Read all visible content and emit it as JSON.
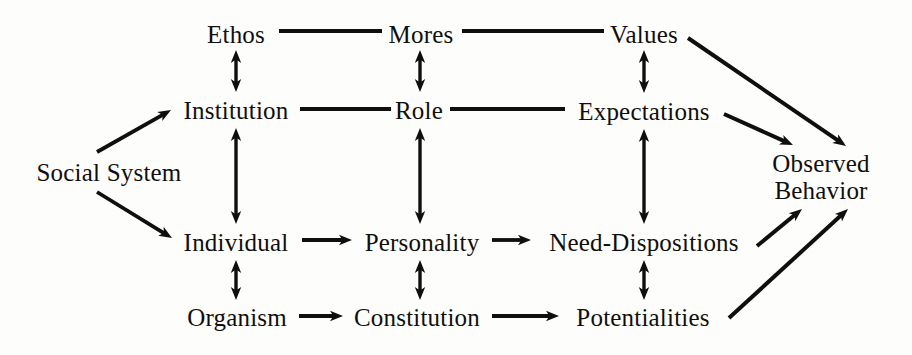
{
  "diagram": {
    "background_color": "#fdfdfb",
    "ink_color": "#100f0d",
    "nodes": [
      {
        "id": "social-system",
        "label": "Social System",
        "x": 109,
        "y": 173,
        "lines": [
          "Social System"
        ]
      },
      {
        "id": "ethos",
        "label": "Ethos",
        "x": 236,
        "y": 35,
        "lines": [
          "Ethos"
        ]
      },
      {
        "id": "mores",
        "label": "Mores",
        "x": 421,
        "y": 35,
        "lines": [
          "Mores"
        ]
      },
      {
        "id": "values",
        "label": "Values",
        "x": 644,
        "y": 35,
        "lines": [
          "Values"
        ]
      },
      {
        "id": "institution",
        "label": "Institution",
        "x": 236,
        "y": 111,
        "lines": [
          "Institution"
        ]
      },
      {
        "id": "role",
        "label": "Role",
        "x": 419,
        "y": 111,
        "lines": [
          "Role"
        ]
      },
      {
        "id": "expectations",
        "label": "Expectations",
        "x": 644,
        "y": 112,
        "lines": [
          "Expectations"
        ]
      },
      {
        "id": "individual",
        "label": "Individual",
        "x": 236,
        "y": 243,
        "lines": [
          "Individual"
        ]
      },
      {
        "id": "personality",
        "label": "Personality",
        "x": 422,
        "y": 243,
        "lines": [
          "Personality"
        ]
      },
      {
        "id": "need-dispositions",
        "label": "Need-Dispositions",
        "x": 644,
        "y": 243,
        "lines": [
          "Need-Dispositions"
        ]
      },
      {
        "id": "organism",
        "label": "Organism",
        "x": 237,
        "y": 318,
        "lines": [
          "Organism"
        ]
      },
      {
        "id": "constitution",
        "label": "Constitution",
        "x": 417,
        "y": 318,
        "lines": [
          "Constitution"
        ]
      },
      {
        "id": "potentialities",
        "label": "Potentialities",
        "x": 643,
        "y": 318,
        "lines": [
          "Potentialities"
        ]
      },
      {
        "id": "observed-behavior",
        "label": "Observed Behavior",
        "x": 821,
        "y": 177,
        "lines": [
          "Observed",
          "Behavior"
        ]
      }
    ],
    "edges": [
      {
        "id": "social-system-to-institution",
        "from": "social-system",
        "to": "institution",
        "style": "single-arrow"
      },
      {
        "id": "social-system-to-individual",
        "from": "social-system",
        "to": "individual",
        "style": "single-arrow"
      },
      {
        "id": "ethos-to-mores",
        "from": "ethos",
        "to": "mores",
        "style": "plain-line"
      },
      {
        "id": "mores-to-values",
        "from": "mores",
        "to": "values",
        "style": "plain-line"
      },
      {
        "id": "institution-to-role",
        "from": "institution",
        "to": "role",
        "style": "plain-line"
      },
      {
        "id": "role-to-expectations",
        "from": "role",
        "to": "expectations",
        "style": "plain-line"
      },
      {
        "id": "ethos-institution",
        "from": "ethos",
        "to": "institution",
        "style": "double-arrow"
      },
      {
        "id": "mores-role",
        "from": "mores",
        "to": "role",
        "style": "double-arrow"
      },
      {
        "id": "values-expectations",
        "from": "values",
        "to": "expectations",
        "style": "double-arrow"
      },
      {
        "id": "institution-individual",
        "from": "institution",
        "to": "individual",
        "style": "double-arrow"
      },
      {
        "id": "role-personality",
        "from": "role",
        "to": "personality",
        "style": "double-arrow"
      },
      {
        "id": "expectations-need-dispositions",
        "from": "expectations",
        "to": "need-dispositions",
        "style": "double-arrow"
      },
      {
        "id": "individual-organism",
        "from": "individual",
        "to": "organism",
        "style": "double-arrow"
      },
      {
        "id": "personality-constitution",
        "from": "personality",
        "to": "constitution",
        "style": "double-arrow"
      },
      {
        "id": "need-dispositions-potentialities",
        "from": "need-dispositions",
        "to": "potentialities",
        "style": "double-arrow"
      },
      {
        "id": "individual-to-personality",
        "from": "individual",
        "to": "personality",
        "style": "single-arrow"
      },
      {
        "id": "personality-to-need-dispositions",
        "from": "personality",
        "to": "need-dispositions",
        "style": "single-arrow"
      },
      {
        "id": "organism-to-constitution",
        "from": "organism",
        "to": "constitution",
        "style": "single-arrow"
      },
      {
        "id": "constitution-to-potentialities",
        "from": "constitution",
        "to": "potentialities",
        "style": "single-arrow"
      },
      {
        "id": "values-to-observed-behavior",
        "from": "values",
        "to": "observed-behavior",
        "style": "single-arrow"
      },
      {
        "id": "expectations-to-observed-behavior",
        "from": "expectations",
        "to": "observed-behavior",
        "style": "single-arrow"
      },
      {
        "id": "need-dispositions-to-observed-behavior",
        "from": "need-dispositions",
        "to": "observed-behavior",
        "style": "single-arrow"
      },
      {
        "id": "potentialities-to-observed-behavior",
        "from": "potentialities",
        "to": "observed-behavior",
        "style": "single-arrow"
      }
    ],
    "edge_geometry": [
      {
        "id": "ethos-to-mores",
        "kind": "line",
        "x1": 279,
        "y1": 31,
        "x2": 382,
        "y2": 31,
        "w": 4.2
      },
      {
        "id": "mores-to-values",
        "kind": "line",
        "x1": 462,
        "y1": 31,
        "x2": 604,
        "y2": 31,
        "w": 4.2
      },
      {
        "id": "institution-to-role",
        "kind": "line",
        "x1": 300,
        "y1": 109,
        "x2": 391,
        "y2": 109,
        "w": 4.2
      },
      {
        "id": "role-to-expectations",
        "kind": "line",
        "x1": 450,
        "y1": 109,
        "x2": 565,
        "y2": 109,
        "w": 4.2
      },
      {
        "id": "ethos-institution",
        "kind": "double",
        "x1": 236,
        "y1": 92,
        "x2": 236,
        "y2": 50,
        "w": 3.4
      },
      {
        "id": "mores-role",
        "kind": "double",
        "x1": 420,
        "y1": 92,
        "x2": 420,
        "y2": 50,
        "w": 3.4
      },
      {
        "id": "values-expectations",
        "kind": "double",
        "x1": 644,
        "y1": 93,
        "x2": 644,
        "y2": 50,
        "w": 3.4
      },
      {
        "id": "institution-individual",
        "kind": "double",
        "x1": 236,
        "y1": 224,
        "x2": 236,
        "y2": 128,
        "w": 3.4
      },
      {
        "id": "role-personality",
        "kind": "double",
        "x1": 420,
        "y1": 224,
        "x2": 420,
        "y2": 128,
        "w": 3.4
      },
      {
        "id": "expectations-need-dispositions",
        "kind": "double",
        "x1": 644,
        "y1": 224,
        "x2": 644,
        "y2": 129,
        "w": 3.4
      },
      {
        "id": "individual-organism",
        "kind": "double",
        "x1": 236,
        "y1": 300,
        "x2": 236,
        "y2": 260,
        "w": 3.4
      },
      {
        "id": "personality-constitution",
        "kind": "double",
        "x1": 420,
        "y1": 300,
        "x2": 420,
        "y2": 260,
        "w": 3.4
      },
      {
        "id": "need-dispositions-potentialities",
        "kind": "double",
        "x1": 644,
        "y1": 300,
        "x2": 644,
        "y2": 260,
        "w": 3.4
      },
      {
        "id": "social-system-to-institution",
        "kind": "arrow",
        "x1": 97,
        "y1": 152,
        "x2": 171,
        "y2": 110,
        "w": 3.8
      },
      {
        "id": "social-system-to-individual",
        "kind": "arrow",
        "x1": 97,
        "y1": 192,
        "x2": 172,
        "y2": 238,
        "w": 3.8
      },
      {
        "id": "individual-to-personality",
        "kind": "arrow",
        "x1": 302,
        "y1": 240,
        "x2": 352,
        "y2": 240,
        "w": 3.8
      },
      {
        "id": "personality-to-need-dispositions",
        "kind": "arrow",
        "x1": 492,
        "y1": 240,
        "x2": 531,
        "y2": 240,
        "w": 3.8
      },
      {
        "id": "organism-to-constitution",
        "kind": "arrow",
        "x1": 299,
        "y1": 316,
        "x2": 343,
        "y2": 316,
        "w": 3.8
      },
      {
        "id": "constitution-to-potentialities",
        "kind": "arrow",
        "x1": 492,
        "y1": 316,
        "x2": 559,
        "y2": 316,
        "w": 3.8
      },
      {
        "id": "values-to-observed-behavior",
        "kind": "arrow",
        "x1": 688,
        "y1": 38,
        "x2": 846,
        "y2": 146,
        "w": 4.0
      },
      {
        "id": "expectations-to-observed-behavior",
        "kind": "arrow",
        "x1": 724,
        "y1": 114,
        "x2": 793,
        "y2": 145,
        "w": 4.0
      },
      {
        "id": "need-dispositions-to-observed-behavior",
        "kind": "arrow",
        "x1": 757,
        "y1": 246,
        "x2": 802,
        "y2": 209,
        "w": 4.0
      },
      {
        "id": "potentialities-to-observed-behavior",
        "kind": "arrow",
        "x1": 729,
        "y1": 318,
        "x2": 848,
        "y2": 209,
        "w": 4.0
      }
    ]
  }
}
